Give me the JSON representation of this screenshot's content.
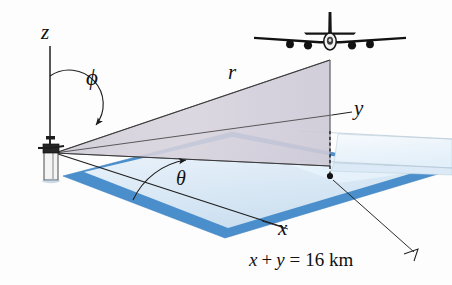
{
  "figure": {
    "background_color": "#fdfdfd"
  },
  "labels": {
    "z_axis": "z",
    "phi_angle": "ϕ",
    "theta_angle": "θ",
    "r_distance": "r",
    "y_axis": "y",
    "x_axis": "x",
    "constraint_x": "x",
    "constraint_plus": "+",
    "constraint_y": "y",
    "constraint_eq": "=",
    "constraint_value": "16 km"
  },
  "callout": {
    "text": "x + y = 16 km"
  },
  "objects": {
    "airplane": "airplane-front-view-4-engine-jet",
    "radar_station": "radar-station-tower-with-dish",
    "ground_plane": "blue-ground-plane-parallelogram",
    "upper_plane": "pale-blue-horizontal-plane",
    "beam_cone": "gray-lavender-radar-beam-fan",
    "drop_line": "vertical-dashed-drop-line"
  },
  "colors": {
    "ground_blue": "#4a8fcc",
    "ground_blue_light": "#cfe2f2",
    "upper_plane": "#eaf3fb",
    "beam_fill": "#d2cfd8",
    "line_dark": "#2b2b2b",
    "text": "#111111",
    "tower_body": "#f2f2f2",
    "tower_dark": "#2a2a2a"
  }
}
